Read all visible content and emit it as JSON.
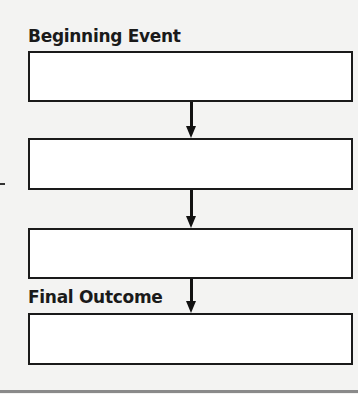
{
  "diagram": {
    "start_label": "Beginning Event",
    "end_label": "Final Outcome",
    "boxes": [
      {
        "id": 1,
        "text": ""
      },
      {
        "id": 2,
        "text": ""
      },
      {
        "id": 3,
        "text": ""
      },
      {
        "id": 4,
        "text": ""
      }
    ],
    "arrows": [
      {
        "from": 1,
        "to": 2
      },
      {
        "from": 2,
        "to": 3
      },
      {
        "from": 3,
        "to": 4
      }
    ],
    "colors": {
      "background": "#f3f3f2",
      "stroke": "#1a1a1a",
      "box_fill": "#ffffff",
      "rule": "#8a8a8a"
    }
  }
}
